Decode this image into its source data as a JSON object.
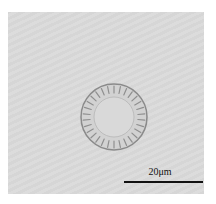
{
  "image": {
    "description": "Light micrograph of a circular centric diatom valve with radial striae",
    "background_color": "#d8d8d8"
  },
  "scale_bar": {
    "label": "20μm",
    "color": "#111111"
  }
}
